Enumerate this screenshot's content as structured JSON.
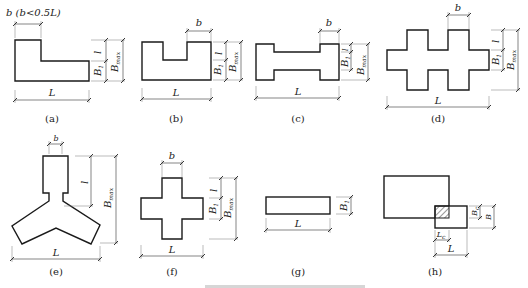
{
  "figures": {
    "a": {
      "caption": "(a)",
      "top_note": "b (b<0.5L)",
      "labels": {
        "l": "l",
        "B1": "B",
        "B1_sub": "1",
        "Bmax": "B",
        "Bmax_sub": "max",
        "L": "L"
      }
    },
    "b": {
      "caption": "(b)",
      "labels": {
        "b": "b",
        "l": "l",
        "B1": "B",
        "B1_sub": "1",
        "Bmax": "B",
        "Bmax_sub": "max",
        "L": "L"
      }
    },
    "c": {
      "caption": "(c)",
      "labels": {
        "b": "b",
        "l": "l",
        "B1": "B",
        "B1_sub": "1",
        "Bmax": "B",
        "Bmax_sub": "max",
        "L": "L"
      }
    },
    "d": {
      "caption": "(d)",
      "labels": {
        "b": "b",
        "l": "l",
        "B1": "B",
        "B1_sub": "1",
        "Bmax": "B",
        "Bmax_sub": "max",
        "L": "L"
      }
    },
    "e": {
      "caption": "(e)",
      "labels": {
        "b": "b",
        "l": "l",
        "Bmax": "B",
        "Bmax_sub": "max",
        "L": "L"
      }
    },
    "f": {
      "caption": "(f)",
      "labels": {
        "b": "b",
        "l": "l",
        "B1": "B",
        "B1_sub": "1",
        "Bmax": "B",
        "Bmax_sub": "max",
        "L": "L"
      }
    },
    "g": {
      "caption": "(g)",
      "labels": {
        "B1": "B",
        "B1_sub": "1",
        "L": "L"
      }
    },
    "h": {
      "caption": "(h)",
      "labels": {
        "Bc": "B",
        "Bc_sub": "c",
        "B": "B",
        "Lc": "L",
        "Lc_sub": "c",
        "L": "L"
      }
    }
  },
  "bottom_caption": "图 平面形状示意图（底部截断）"
}
